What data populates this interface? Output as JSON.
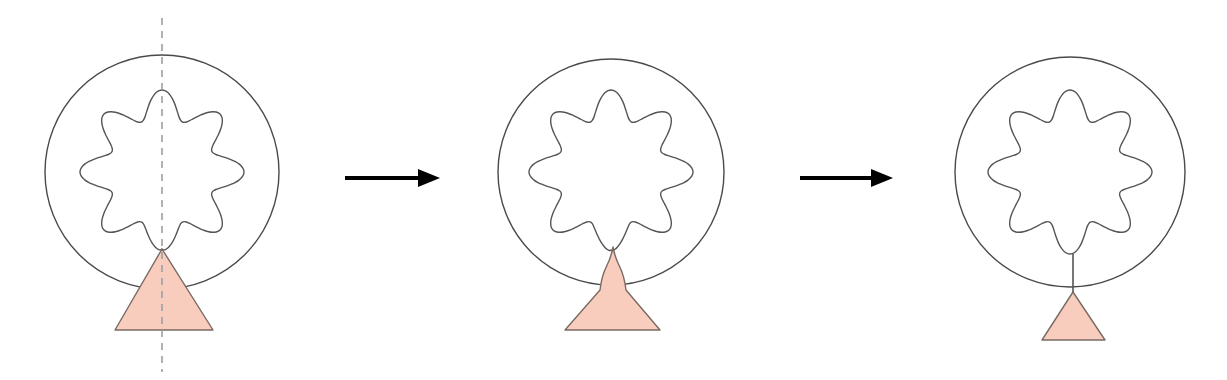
{
  "figure": {
    "type": "diagram",
    "width": 1227,
    "height": 380,
    "background": "#ffffff"
  },
  "colors": {
    "outline": "#4a4a4a",
    "flower_outline": "#555555",
    "triangle_fill": "#f9cdbd",
    "triangle_stroke": "#7a6a64",
    "arrow": "#000000",
    "axis_dashed": "#9aa0a6",
    "connector": "#555555"
  },
  "geometry": {
    "circle_radius_1": 117,
    "circle_radius_2": 113,
    "circle_radius_3": 115,
    "flower_lobes": 8,
    "flower_outer_radius": 82,
    "flower_inner_radius": 54,
    "stroke_width_circle": 1.4,
    "stroke_width_flower": 1.4,
    "stroke_width_triangle": 1.4,
    "dash_pattern": "7,6"
  },
  "panels": [
    {
      "id": "panel-1",
      "index": 1,
      "label": "initial state",
      "center": {
        "x": 162,
        "y": 172
      },
      "circle_radius": 117,
      "flower_rotation_deg": 0,
      "symmetry_axis": {
        "visible": true,
        "x": 162,
        "y1": 18,
        "y2": 372
      },
      "triangle": {
        "name": "wide-triangle",
        "apex": {
          "x": 162,
          "y": 249
        },
        "base_left": {
          "x": 115,
          "y": 330
        },
        "base_right": {
          "x": 213,
          "y": 330
        },
        "state": "overlapping"
      },
      "connector": {
        "visible": false
      },
      "neck": {
        "visible": false
      }
    },
    {
      "id": "panel-2",
      "index": 2,
      "label": "necking state",
      "center": {
        "x": 611,
        "y": 172
      },
      "circle_radius": 113,
      "flower_rotation_deg": 0,
      "symmetry_axis": {
        "visible": false
      },
      "triangle": {
        "name": "pinched-triangle",
        "apex": {
          "x": 613,
          "y": 247
        },
        "base_left": {
          "x": 565,
          "y": 330
        },
        "base_right": {
          "x": 660,
          "y": 330
        },
        "waist": {
          "x": 613,
          "y": 290,
          "half_width": 13
        },
        "state": "necking"
      },
      "connector": {
        "visible": false
      },
      "neck": {
        "visible": true
      }
    },
    {
      "id": "panel-3",
      "index": 3,
      "label": "detached state",
      "center": {
        "x": 1070,
        "y": 172
      },
      "circle_radius": 115,
      "flower_rotation_deg": 0,
      "symmetry_axis": {
        "visible": false
      },
      "triangle": {
        "name": "small-triangle",
        "apex": {
          "x": 1073,
          "y": 292
        },
        "base_left": {
          "x": 1042,
          "y": 340
        },
        "base_right": {
          "x": 1105,
          "y": 340
        },
        "state": "detached"
      },
      "connector": {
        "visible": true,
        "x": 1073,
        "y1": 254,
        "y2": 292
      },
      "neck": {
        "visible": false
      }
    }
  ],
  "arrows": [
    {
      "id": "arrow-1",
      "name": "transition-arrow-1",
      "from_panel": "panel-1",
      "to_panel": "panel-2",
      "x1": 345,
      "x2": 440,
      "y": 178,
      "head_length": 22,
      "head_width": 18,
      "stroke_width": 4
    },
    {
      "id": "arrow-2",
      "name": "transition-arrow-2",
      "from_panel": "panel-2",
      "to_panel": "panel-3",
      "x1": 800,
      "x2": 893,
      "y": 178,
      "head_length": 22,
      "head_width": 18,
      "stroke_width": 4
    }
  ]
}
